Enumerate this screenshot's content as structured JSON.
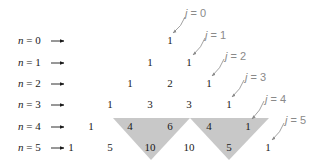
{
  "colors": {
    "text": "#1a1a1a",
    "j_label": "#8a8a8a",
    "shade": "#c8c8c8"
  },
  "row_labels": [
    {
      "var": "n",
      "eq": "= 0"
    },
    {
      "var": "n",
      "eq": "= 1"
    },
    {
      "var": "n",
      "eq": "= 2"
    },
    {
      "var": "n",
      "eq": "= 3"
    },
    {
      "var": "n",
      "eq": "= 4"
    },
    {
      "var": "n",
      "eq": "= 5"
    }
  ],
  "rows": [
    [
      "1"
    ],
    [
      "1",
      "1"
    ],
    [
      "1",
      "2",
      "1"
    ],
    [
      "1",
      "3",
      "3",
      "1"
    ],
    [
      "1",
      "4",
      "6",
      "4",
      "1"
    ],
    [
      "1",
      "5",
      "10",
      "10",
      "5",
      "1"
    ]
  ],
  "j_labels": [
    {
      "var": "j",
      "eq": "= 0"
    },
    {
      "var": "j",
      "eq": "= 1"
    },
    {
      "var": "j",
      "eq": "= 2"
    },
    {
      "var": "j",
      "eq": "= 3"
    },
    {
      "var": "j",
      "eq": "= 4"
    },
    {
      "var": "j",
      "eq": "= 5"
    }
  ],
  "shaded_triangles": [
    {
      "top": [
        "4",
        "6"
      ],
      "bottom": "10"
    },
    {
      "top": [
        "4",
        "1"
      ],
      "bottom": "5"
    }
  ]
}
